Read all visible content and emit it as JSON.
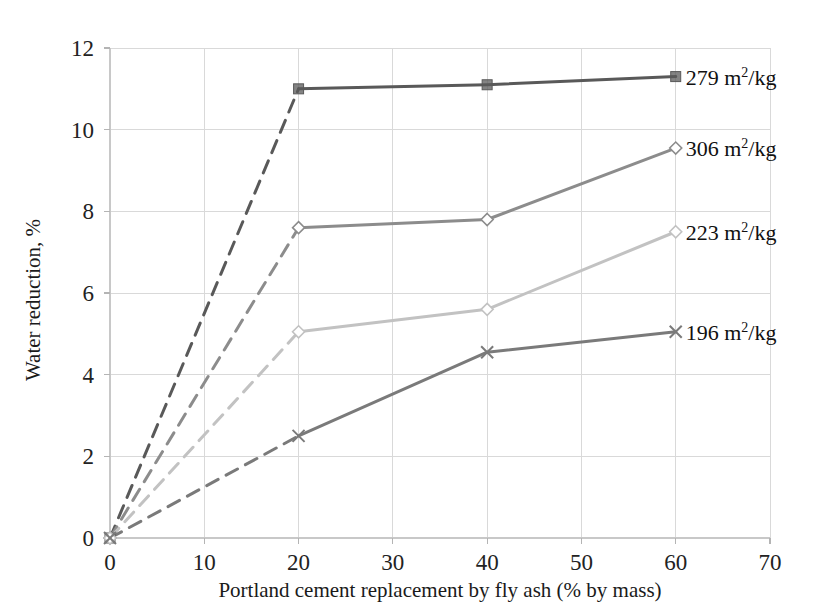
{
  "chart_data": {
    "type": "line",
    "title": "",
    "xlabel": "Portland cement replacement by fly ash (% by mass)",
    "ylabel": "Water reduction, %",
    "xlim": [
      0,
      70
    ],
    "ylim": [
      0,
      12
    ],
    "xticks": [
      "0",
      "10",
      "20",
      "30",
      "40",
      "50",
      "60",
      "70"
    ],
    "yticks": [
      "0",
      "2",
      "4",
      "6",
      "8",
      "10",
      "12"
    ],
    "xtick_values": [
      0,
      10,
      20,
      30,
      40,
      50,
      60,
      70
    ],
    "ytick_values": [
      0,
      2,
      4,
      6,
      8,
      10,
      12
    ],
    "grid": true,
    "legend_position": "right-inline-annotations",
    "x": [
      0,
      20,
      40,
      60
    ],
    "series": [
      {
        "name": "279 m2/kg",
        "label_number": "279",
        "label_unit_base": "m",
        "label_unit_exp": "2",
        "label_unit_tail": "/kg",
        "values": [
          0,
          11.0,
          11.1,
          11.3
        ],
        "color": "#595959",
        "marker": "square",
        "dashed_first_segment": true
      },
      {
        "name": "306 m2/kg",
        "label_number": "306",
        "label_unit_base": "m",
        "label_unit_exp": "2",
        "label_unit_tail": "/kg",
        "values": [
          0,
          7.6,
          7.8,
          9.55
        ],
        "color": "#8c8c8c",
        "marker": "diamond",
        "dashed_first_segment": true
      },
      {
        "name": "223 m2/kg",
        "label_number": "223",
        "label_unit_base": "m",
        "label_unit_exp": "2",
        "label_unit_tail": "/kg",
        "values": [
          0,
          5.05,
          5.6,
          7.5
        ],
        "color": "#c2c2c2",
        "marker": "diamond",
        "dashed_first_segment": true
      },
      {
        "name": "196 m2/kg",
        "label_number": "196",
        "label_unit_base": "m",
        "label_unit_exp": "2",
        "label_unit_tail": "/kg",
        "values": [
          0,
          2.5,
          4.55,
          5.05
        ],
        "color": "#7a7a7a",
        "marker": "cross",
        "dashed_first_segment": true
      }
    ],
    "colors": {
      "grid": "#d9d9d9",
      "axis": "#c8c8c8",
      "text": "#1a1a1a",
      "background": "#ffffff"
    }
  }
}
